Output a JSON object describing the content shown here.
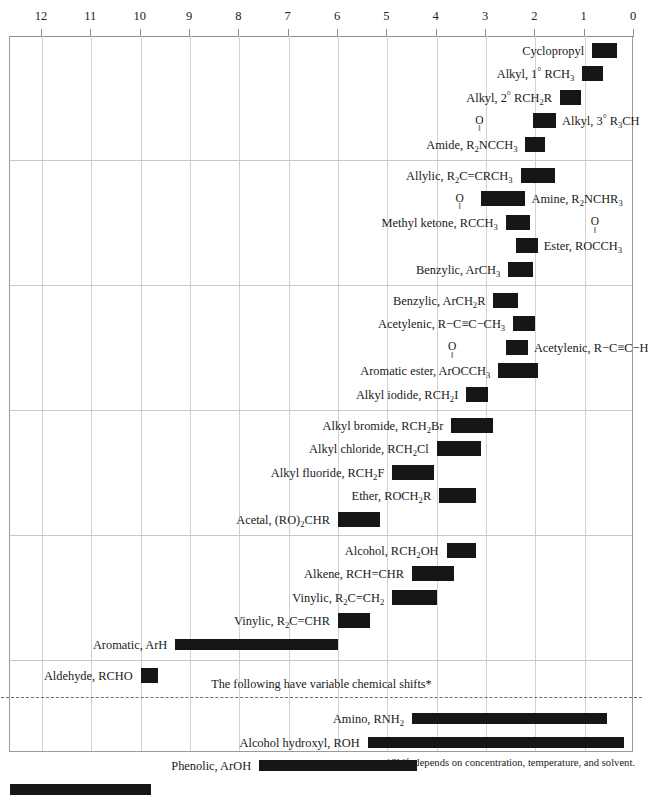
{
  "chart_data": {
    "type": "bar",
    "orientation": "horizontal-range",
    "title": "",
    "xlabel": "",
    "ylabel": "",
    "xlim": [
      12.8,
      0
    ],
    "axis_ticks": [
      12,
      11,
      10,
      9,
      8,
      7,
      6,
      5,
      4,
      3,
      2,
      1,
      0
    ],
    "grid": "vertical",
    "legend": "none",
    "annotations": {
      "variable_shift_note": "The following have variable chemical shifts*",
      "footnote": "*Shift depends on concentration, temperature, and solvent."
    },
    "sections": [
      {
        "rows": [
          {
            "label_html": "Cyclopropyl",
            "label_side": "left",
            "start": 0.85,
            "end": 0.35
          },
          {
            "label_html": "Alkyl, 1<span class=\"deg\">&#176;</span> RCH<sub>3</sub>",
            "label_side": "left",
            "start": 1.05,
            "end": 0.62
          },
          {
            "label_html": "Alkyl, 2<span class=\"deg\">&#176;</span> RCH<sub>2</sub>R",
            "label_side": "left",
            "start": 1.5,
            "end": 1.08
          },
          {
            "label_html": "Alkyl, 3<span class=\"deg\">&#176;</span> R<sub>3</sub>CH",
            "label_side": "right",
            "start": 2.05,
            "end": 1.58,
            "carbonyl": false
          },
          {
            "label_html": "Amide, R<sub>2</sub>NCCH<sub>3</sub>",
            "label_side": "left",
            "start": 2.2,
            "end": 1.8,
            "carbonyl": true,
            "carbonyl_at": 0.5
          }
        ]
      },
      {
        "rows": [
          {
            "label_html": "Allylic, R<sub>2</sub>C=CRCH<sub>3</sub>",
            "label_side": "left",
            "start": 2.3,
            "end": 1.6
          },
          {
            "label_html": "Amine, R<sub>2</sub>NCHR<sub>3</sub>",
            "label_side": "right",
            "start": 3.1,
            "end": 2.2
          },
          {
            "label_html": "Methyl ketone, RCCH<sub>3</sub>",
            "label_side": "left",
            "start": 2.6,
            "end": 2.1,
            "carbonyl": true,
            "carbonyl_at": 0.45
          },
          {
            "label_html": "Ester, ROCCH<sub>3</sub>",
            "label_side": "right",
            "start": 2.4,
            "end": 1.95,
            "carbonyl": true,
            "carbonyl_at": 0.5
          },
          {
            "label_html": "Benzylic, ArCH<sub>3</sub>",
            "label_side": "left",
            "start": 2.55,
            "end": 2.05
          }
        ]
      },
      {
        "rows": [
          {
            "label_html": "Benzylic, ArCH<sub>2</sub>R",
            "label_side": "left",
            "start": 2.85,
            "end": 2.35
          },
          {
            "label_html": "Acetylenic, R&#8722;C&#8801;C&#8722;CH<sub>3</sub>",
            "label_side": "left",
            "start": 2.45,
            "end": 2.0
          },
          {
            "label_html": "Acetylenic, R&#8722;C&#8801;C&#8722;H",
            "label_side": "right",
            "start": 2.6,
            "end": 2.15
          },
          {
            "label_html": "Aromatic ester, ArOCCH<sub>3</sub>",
            "label_side": "left",
            "start": 2.75,
            "end": 1.95,
            "carbonyl": true,
            "carbonyl_at": 0.4
          },
          {
            "label_html": "Alkyl iodide, RCH<sub>2</sub>I",
            "label_side": "left",
            "start": 3.4,
            "end": 2.95
          }
        ]
      },
      {
        "rows": [
          {
            "label_html": "Alkyl bromide, RCH<sub>2</sub>Br",
            "label_side": "left",
            "start": 3.7,
            "end": 2.85
          },
          {
            "label_html": "Alkyl chloride, RCH<sub>2</sub>Cl",
            "label_side": "left",
            "start": 4.0,
            "end": 3.1
          },
          {
            "label_html": "Alkyl fluoride, RCH<sub>2</sub>F",
            "label_side": "left",
            "start": 4.9,
            "end": 4.05
          },
          {
            "label_html": "Ether, ROCH<sub>2</sub>R",
            "label_side": "left",
            "start": 3.95,
            "end": 3.2
          },
          {
            "label_html": "Acetal, (RO)<sub>2</sub>CHR",
            "label_side": "left",
            "start": 6.0,
            "end": 5.15
          }
        ]
      },
      {
        "rows": [
          {
            "label_html": "Alcohol, RCH<sub>2</sub>OH",
            "label_side": "left",
            "start": 3.8,
            "end": 3.2
          },
          {
            "label_html": "Alkene, RCH=CHR",
            "label_side": "left",
            "start": 4.5,
            "end": 3.65
          },
          {
            "label_html": "Vinylic, R<sub>2</sub>C=CH<sub>2</sub>",
            "label_side": "left",
            "start": 4.9,
            "end": 4.0
          },
          {
            "label_html": "Vinylic, R<sub>2</sub>C=CHR",
            "label_side": "left",
            "start": 6.0,
            "end": 5.35
          },
          {
            "label_html": "Aromatic, ArH",
            "label_side": "left",
            "start": 9.3,
            "end": 6.0
          }
        ]
      },
      {
        "rows": [
          {
            "label_html": "Aldehyde, RCHO",
            "label_side": "left",
            "start": 10.0,
            "end": 9.65
          }
        ]
      },
      {
        "variable": true,
        "rows": [
          {
            "label_html": "Amino, RNH<sub>2</sub>",
            "label_side": "left",
            "start": 4.5,
            "end": 0.55
          },
          {
            "label_html": "Alcohol hydroxyl, ROH",
            "label_side": "left",
            "start": 5.4,
            "end": 0.2
          },
          {
            "label_html": "Phenolic, ArOH",
            "label_side": "left",
            "start": 7.6,
            "end": 4.4
          },
          {
            "label_html": "Carboxylic, RCOOH",
            "label_side": "left",
            "start": 12.7,
            "end": 9.8
          }
        ]
      }
    ]
  },
  "colors": {
    "bar": "#161616",
    "frame": "#9a9a9a",
    "grid": "#d2d2d2",
    "divider": "#c9c9c9",
    "dashed_divider": "#6e6e6e",
    "text": "#1a1a1a",
    "background": "#ffffff"
  }
}
